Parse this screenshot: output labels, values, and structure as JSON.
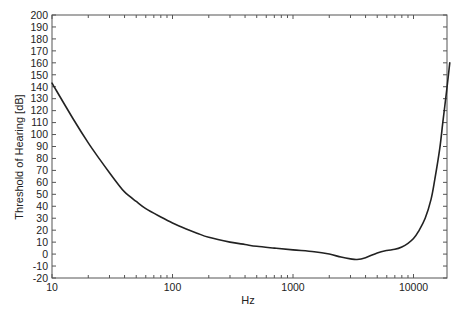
{
  "chart_data": {
    "type": "line",
    "title": "",
    "xlabel": "Hz",
    "ylabel": "Threshold of Hearing [dB]",
    "xscale": "log",
    "xlim": [
      10,
      20000
    ],
    "ylim": [
      -20,
      200
    ],
    "grid": false,
    "legend": null,
    "x_tick_labels": [
      "10",
      "100",
      "1000",
      "10000"
    ],
    "x_ticks": [
      10,
      100,
      1000,
      10000
    ],
    "y_ticks": [
      -20,
      -10,
      0,
      10,
      20,
      30,
      40,
      50,
      60,
      70,
      80,
      90,
      100,
      110,
      120,
      130,
      140,
      150,
      160,
      170,
      180,
      190,
      200
    ],
    "series": [
      {
        "name": "Threshold of Hearing",
        "color": "#222222",
        "x": [
          10,
          15,
          20,
          25,
          30,
          35,
          40,
          50,
          60,
          80,
          100,
          130,
          160,
          200,
          300,
          400,
          500,
          700,
          1000,
          1500,
          2000,
          2500,
          3000,
          3400,
          4000,
          5000,
          6000,
          7000,
          8000,
          9000,
          10000,
          11000,
          12500,
          14000,
          15000,
          16500,
          17500,
          18500,
          19500,
          20000
        ],
        "y": [
          143,
          113,
          93,
          79,
          68,
          59,
          52,
          44,
          38,
          31,
          26,
          21,
          17.5,
          14,
          10,
          8,
          6.5,
          5,
          3.5,
          2,
          0,
          -2.5,
          -4,
          -4.5,
          -3,
          1,
          3,
          4,
          6,
          9,
          13,
          19,
          30,
          46,
          62,
          88,
          110,
          130,
          150,
          160
        ]
      }
    ]
  },
  "axes": {
    "x_title": "Hz",
    "y_title": "Threshold of Hearing [dB]"
  }
}
